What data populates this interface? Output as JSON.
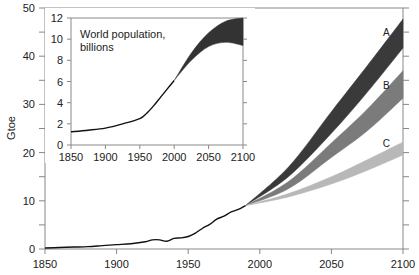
{
  "chart_data": [
    {
      "id": "main",
      "type": "area",
      "title": "",
      "xlabel": "",
      "ylabel": "Gtoe",
      "xlim": [
        1850,
        2100
      ],
      "ylim": [
        0,
        50
      ],
      "x_ticks": [
        1850,
        1900,
        1950,
        2000,
        2050,
        2100
      ],
      "y_ticks": [
        0,
        10,
        20,
        30,
        40,
        50
      ],
      "grid": false,
      "history": {
        "name": "Historical primary energy use",
        "x": [
          1850,
          1860,
          1870,
          1880,
          1890,
          1900,
          1910,
          1920,
          1925,
          1930,
          1935,
          1940,
          1945,
          1950,
          1955,
          1960,
          1965,
          1970,
          1975,
          1980,
          1985,
          1990
        ],
        "y": [
          0.2,
          0.3,
          0.4,
          0.5,
          0.7,
          0.9,
          1.1,
          1.5,
          1.9,
          1.9,
          1.6,
          2.2,
          2.3,
          2.6,
          3.3,
          4.3,
          5.1,
          6.2,
          6.8,
          7.7,
          8.2,
          9.0
        ]
      },
      "series": [
        {
          "name": "A",
          "color": "#3a3a3a",
          "x": [
            1990,
            2020,
            2050,
            2075,
            2100
          ],
          "upper": [
            9.0,
            17.0,
            28.5,
            38.0,
            47.7
          ],
          "lower": [
            9.0,
            15.0,
            24.0,
            32.5,
            41.7
          ]
        },
        {
          "name": "B",
          "color": "#7b7b7b",
          "x": [
            1990,
            2020,
            2050,
            2075,
            2100
          ],
          "upper": [
            9.0,
            14.0,
            22.0,
            29.0,
            37.0
          ],
          "lower": [
            9.0,
            12.5,
            19.0,
            24.5,
            31.3
          ]
        },
        {
          "name": "C",
          "color": "#b8b8b8",
          "x": [
            1990,
            2020,
            2050,
            2075,
            2100
          ],
          "upper": [
            9.0,
            11.5,
            15.0,
            18.5,
            22.2
          ],
          "lower": [
            9.0,
            10.8,
            13.5,
            16.3,
            19.5
          ]
        }
      ],
      "annotations": [
        {
          "text": "A",
          "x": 2094,
          "y": 45
        },
        {
          "text": "B",
          "x": 2094,
          "y": 34
        },
        {
          "text": "C",
          "x": 2094,
          "y": 22
        }
      ]
    },
    {
      "id": "inset",
      "type": "area",
      "title": "World population, billions",
      "xlabel": "",
      "ylabel": "",
      "xlim": [
        1850,
        2100
      ],
      "ylim": [
        0,
        12
      ],
      "x_ticks": [
        1850,
        1900,
        1950,
        2000,
        2050,
        2100
      ],
      "y_ticks": [
        0,
        2,
        4,
        6,
        8,
        10,
        12
      ],
      "grid": false,
      "history": {
        "name": "Historical population",
        "x": [
          1850,
          1875,
          1900,
          1925,
          1950,
          1960,
          1970,
          1980,
          1990,
          2000
        ],
        "y": [
          1.25,
          1.4,
          1.6,
          2.0,
          2.5,
          3.0,
          3.7,
          4.5,
          5.3,
          6.1
        ]
      },
      "series": [
        {
          "name": "Population projection range",
          "color": "#333333",
          "x": [
            2000,
            2025,
            2050,
            2075,
            2100
          ],
          "upper": [
            6.1,
            8.7,
            10.6,
            11.7,
            12.0
          ],
          "lower": [
            6.1,
            8.0,
            9.3,
            9.7,
            9.4
          ]
        }
      ]
    }
  ]
}
